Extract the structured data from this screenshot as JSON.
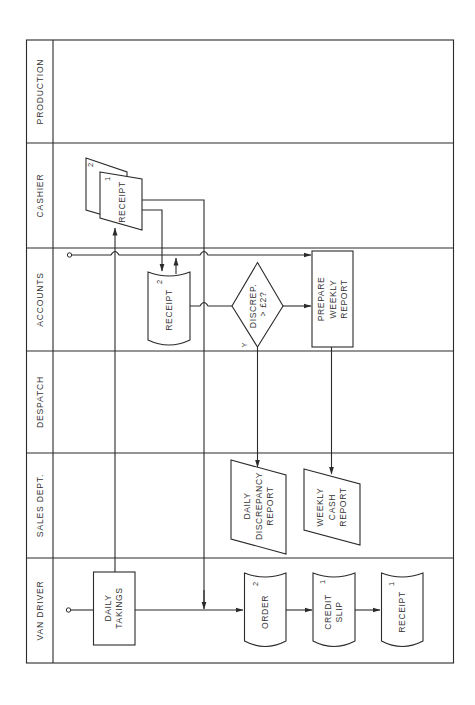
{
  "diagram": {
    "type": "swimlane-flowchart",
    "orientation": "rotated-90-ccw",
    "lanes": [
      {
        "id": "production",
        "label": "PRODUCTION"
      },
      {
        "id": "cashier",
        "label": "CASHIER"
      },
      {
        "id": "accounts",
        "label": "ACCOUNTS"
      },
      {
        "id": "despatch",
        "label": "DESPATCH"
      },
      {
        "id": "sales",
        "label": "SALES DEPT."
      },
      {
        "id": "van_driver",
        "label": "VAN DRIVER"
      }
    ],
    "nodes": {
      "cashier_receipt": {
        "label": "RECEIPT",
        "copy_back": "2",
        "copy_front": "1",
        "shape": "multi-document"
      },
      "accounts_receipt": {
        "label": "RECEIPT",
        "copy": "2",
        "shape": "document"
      },
      "discrepancy_decision": {
        "line1": "DISCREP.",
        "line2": "> £2?",
        "yes_label": "Y",
        "shape": "decision"
      },
      "prepare_weekly_report": {
        "line1": "PREPARE",
        "line2": "WEEKLY",
        "line3": "REPORT",
        "shape": "process"
      },
      "daily_discrepancy_report": {
        "line1": "DAILY",
        "line2": "DISCREPANCY",
        "line3": "REPORT",
        "shape": "parallelogram"
      },
      "weekly_cash_report": {
        "line1": "WEEKLY",
        "line2": "CASH",
        "line3": "REPORT",
        "shape": "parallelogram"
      },
      "daily_takings": {
        "line1": "DAILY",
        "line2": "TAKINGS",
        "shape": "process"
      },
      "order": {
        "label": "ORDER",
        "copy": "2",
        "shape": "document"
      },
      "credit_slip": {
        "line1": "CREDIT",
        "line2": "SLIP",
        "copy": "1",
        "shape": "document"
      },
      "van_receipt": {
        "label": "RECEIPT",
        "copy": "1",
        "shape": "document"
      }
    },
    "colors": {
      "line": "#2a2a2a",
      "text": "#333333",
      "background": "#ffffff"
    }
  }
}
